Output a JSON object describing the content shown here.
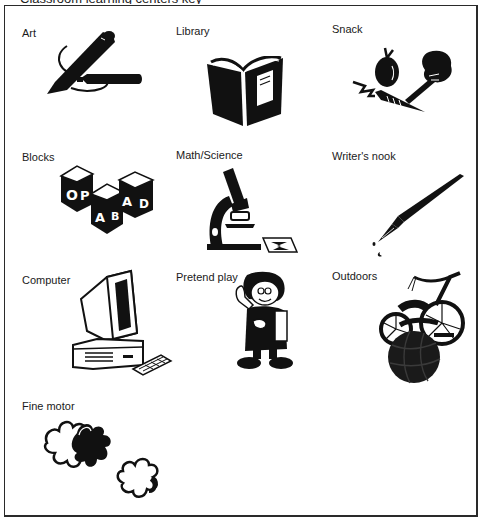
{
  "header": {
    "clipped_title": "Classroom learning centers key"
  },
  "centers": [
    {
      "label": "Art",
      "icon": "markers-icon"
    },
    {
      "label": "Library",
      "icon": "book-icon"
    },
    {
      "label": "Snack",
      "icon": "fruit-vegetables-icon"
    },
    {
      "label": "Blocks",
      "icon": "alphabet-blocks-icon"
    },
    {
      "label": "Math/Science",
      "icon": "microscope-icon"
    },
    {
      "label": "Writer's nook",
      "icon": "fountain-pen-icon"
    },
    {
      "label": "Computer",
      "icon": "computer-icon"
    },
    {
      "label": "Pretend play",
      "icon": "pretend-child-icon"
    },
    {
      "label": "Outdoors",
      "icon": "tricycle-ball-icon"
    },
    {
      "label": "Fine motor",
      "icon": "puzzle-pieces-icon"
    }
  ],
  "blocks_letters": [
    "O",
    "P",
    "A",
    "B",
    "A",
    "D"
  ],
  "colors": {
    "ink": "#111111",
    "paper": "#ffffff",
    "frame": "#2a2a2a"
  }
}
